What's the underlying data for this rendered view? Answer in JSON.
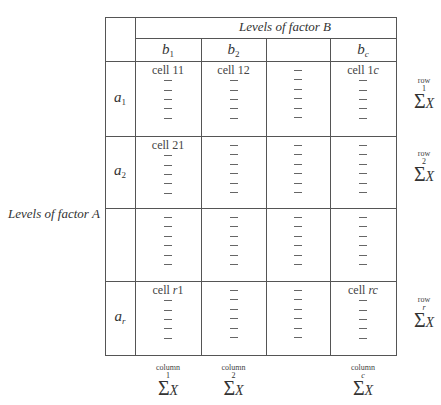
{
  "figure": {
    "factor_b_label": "Levels of factor B",
    "factor_a_label": "Levels of factor A",
    "columns": [
      {
        "id": "b1",
        "var": "b",
        "sub": "1"
      },
      {
        "id": "b2",
        "var": "b",
        "sub": "2"
      },
      {
        "id": "blank",
        "var": "",
        "sub": ""
      },
      {
        "id": "bc",
        "var": "b",
        "sub": "c"
      }
    ],
    "rows": [
      {
        "id": "a1",
        "var": "a",
        "sub": "1",
        "cells": [
          {
            "label": "cell 11",
            "dashes": 5
          },
          {
            "label": "cell 12",
            "dashes": 5
          },
          {
            "label": "",
            "dashes": 6
          },
          {
            "label": "cell 1c",
            "dashes": 5
          }
        ],
        "sum": {
          "label": "row",
          "index": "1",
          "sigma": "Σ",
          "x": "X"
        }
      },
      {
        "id": "a2",
        "var": "a",
        "sub": "2",
        "cells": [
          {
            "label": "cell 21",
            "dashes": 5
          },
          {
            "label": "",
            "dashes": 6
          },
          {
            "label": "",
            "dashes": 6
          },
          {
            "label": "",
            "dashes": 6
          }
        ],
        "sum": {
          "label": "row",
          "index": "2",
          "sigma": "Σ",
          "x": "X"
        }
      },
      {
        "id": "blank",
        "var": "",
        "sub": "",
        "cells": [
          {
            "label": "",
            "dashes": 6
          },
          {
            "label": "",
            "dashes": 6
          },
          {
            "label": "",
            "dashes": 6
          },
          {
            "label": "",
            "dashes": 6
          }
        ],
        "sum": null
      },
      {
        "id": "ar",
        "var": "a",
        "sub": "r",
        "cells": [
          {
            "label": "cell r1",
            "dashes": 5
          },
          {
            "label": "",
            "dashes": 6
          },
          {
            "label": "",
            "dashes": 6
          },
          {
            "label": "cell rc",
            "dashes": 5
          }
        ],
        "sum": {
          "label": "row",
          "index": "r",
          "sigma": "Σ",
          "x": "X"
        }
      }
    ],
    "column_sums": [
      {
        "label": "column",
        "index": "1",
        "sigma": "Σ",
        "x": "X"
      },
      {
        "label": "column",
        "index": "2",
        "sigma": "Σ",
        "x": "X"
      },
      null,
      {
        "label": "column",
        "index": "c",
        "sigma": "Σ",
        "x": "X"
      }
    ]
  }
}
